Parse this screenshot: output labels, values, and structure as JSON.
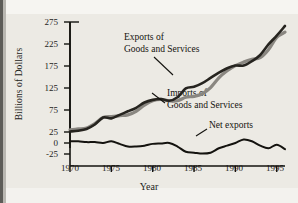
{
  "figure": {
    "background_color": "#eceae4",
    "ink_color": "#14130f"
  },
  "axes": {
    "ylabel": "Billions of Dollars",
    "xlabel": "Year",
    "yticks": [
      "275",
      "225",
      "175",
      "125",
      "75",
      "25",
      "0",
      "-25"
    ],
    "xticks": [
      "1970",
      "1975",
      "1980",
      "1985",
      "1990",
      "1995"
    ]
  },
  "annotations": {
    "exports_line1": "Exports of",
    "exports_line2": "Goods and Services",
    "imports_line1": "Imports of",
    "imports_line2": "Goods and Services",
    "net": "Net exports"
  },
  "chart_data": {
    "type": "line",
    "title": "",
    "xlabel": "Year",
    "ylabel": "Billions of Dollars",
    "xlim": [
      1970,
      1996
    ],
    "ylim": [
      -25,
      275
    ],
    "yticks": [
      -25,
      0,
      25,
      75,
      125,
      175,
      225,
      275
    ],
    "xticks": [
      1970,
      1975,
      1980,
      1985,
      1990,
      1995
    ],
    "grid": false,
    "legend": "inline-annotations",
    "x": [
      1970,
      1971,
      1972,
      1973,
      1974,
      1975,
      1976,
      1977,
      1978,
      1979,
      1980,
      1981,
      1982,
      1983,
      1984,
      1985,
      1986,
      1987,
      1988,
      1989,
      1990,
      1991,
      1992,
      1993,
      1994,
      1995,
      1996
    ],
    "series": [
      {
        "name": "Exports of Goods and Services",
        "color": "#8a8781",
        "values": [
          30,
          32,
          34,
          44,
          58,
          60,
          62,
          64,
          72,
          86,
          96,
          99,
          96,
          96,
          104,
          106,
          112,
          126,
          148,
          164,
          176,
          184,
          190,
          194,
          212,
          240,
          252
        ]
      },
      {
        "name": "Imports of Goods and Services",
        "color": "#26241f",
        "values": [
          26,
          28,
          32,
          42,
          58,
          56,
          64,
          72,
          80,
          92,
          98,
          100,
          96,
          104,
          124,
          128,
          136,
          148,
          160,
          170,
          176,
          176,
          186,
          200,
          224,
          244,
          266
        ]
      },
      {
        "name": "Net exports",
        "color": "#14130f",
        "values": [
          4,
          4,
          2,
          2,
          0,
          4,
          -2,
          -8,
          -8,
          -6,
          -2,
          -1,
          0,
          -8,
          -20,
          -22,
          -24,
          -22,
          -12,
          -6,
          0,
          8,
          4,
          -6,
          -12,
          -4,
          -14
        ]
      }
    ]
  }
}
